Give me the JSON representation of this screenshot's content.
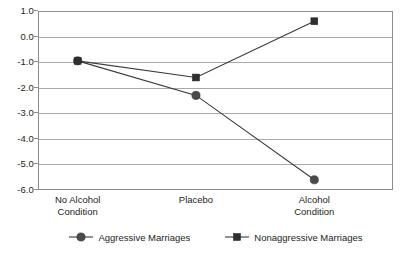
{
  "chart_data": {
    "type": "line",
    "title": "",
    "subtitle": "",
    "xlabel": "",
    "ylabel": "",
    "categories": [
      "No Alcohol\nCondition",
      "Placebo",
      "Alcohol\nCondition"
    ],
    "category_labels": [
      {
        "line1": "No Alcohol",
        "line2": "Condition"
      },
      {
        "line1": "Placebo",
        "line2": ""
      },
      {
        "line1": "Alcohol",
        "line2": "Condition"
      }
    ],
    "series": [
      {
        "name": "Aggressive Marriages",
        "marker": "circle",
        "color": "#4a4a4a",
        "values": [
          -0.95,
          -2.3,
          -5.6
        ]
      },
      {
        "name": "Nonaggressive Marriages",
        "marker": "square",
        "color": "#2f2f2f",
        "values": [
          -0.95,
          -1.6,
          0.6
        ]
      }
    ],
    "ylim": [
      -6.0,
      1.0
    ],
    "ytick_labels": [
      "1.0",
      "0.0",
      "-1.0",
      "-2.0",
      "-3.0",
      "-4.0",
      "-5.0",
      "-6.0"
    ],
    "ytick_values": [
      1.0,
      0.0,
      -1.0,
      -2.0,
      -3.0,
      -4.0,
      -5.0,
      -6.0
    ],
    "grid": true,
    "grid_axis": "y",
    "legend_position": "bottom",
    "plot_border_color": "#8d8d8d",
    "gridline_color": "#a9a9a9",
    "background_color": "#ffffff"
  },
  "legend": {
    "entries": [
      {
        "label": "Aggressive Marriages",
        "marker": "circle"
      },
      {
        "label": "Nonaggressive Marriages",
        "marker": "square"
      }
    ]
  }
}
